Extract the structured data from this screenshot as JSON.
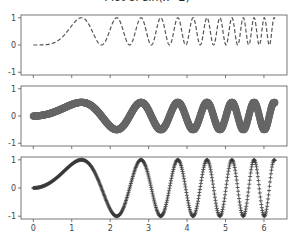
{
  "title": "Plot of sin(x^2)",
  "colors": {
    "axes": "#555555",
    "panel1_line": "#555555",
    "panel2_marker": "#666666",
    "panel3_marker": "#3a3a3a",
    "tick_label": "#444444"
  },
  "chart_data": [
    {
      "type": "line",
      "panel": 1,
      "title": "",
      "function": "sin(x^2)^2",
      "style": "dashed line",
      "xlim": [
        -0.32,
        6.6
      ],
      "ylim": [
        -1.1,
        1.1
      ],
      "yticks": [
        -1,
        0,
        1
      ],
      "xticks": [
        0,
        1,
        2,
        3,
        4,
        5,
        6
      ],
      "x": [
        0,
        0.5,
        1.0,
        1.25,
        1.5,
        1.77,
        2.0,
        2.17,
        2.5,
        2.8,
        3.0,
        3.5,
        4.0,
        4.5,
        5.0,
        5.5,
        6.0,
        6.28
      ],
      "values": [
        0,
        0.06,
        0.71,
        1.0,
        0.61,
        0.0,
        0.57,
        1.0,
        0.0,
        1.0,
        0.17,
        0.1,
        0.08,
        0.88,
        0.02,
        0.42,
        0.98,
        0.96
      ]
    },
    {
      "type": "scatter",
      "panel": 2,
      "function": "0.5*sin(x^2)",
      "style": "large circle markers",
      "xlim": [
        -0.32,
        6.6
      ],
      "ylim": [
        -1.1,
        1.1
      ],
      "yticks": [
        -1,
        0,
        1
      ],
      "xticks": [
        0,
        1,
        2,
        3,
        4,
        5,
        6
      ],
      "x": [
        0,
        0.5,
        1.0,
        1.25,
        1.5,
        1.77,
        2.0,
        2.17,
        2.5,
        2.8,
        3.0,
        3.5,
        4.0,
        4.5,
        5.0,
        5.5,
        6.0,
        6.28
      ],
      "values": [
        0,
        0.12,
        0.42,
        0.5,
        0.39,
        0.0,
        -0.38,
        -0.5,
        0.02,
        0.5,
        0.21,
        -0.16,
        -0.14,
        0.47,
        -0.07,
        0.33,
        -0.5,
        -0.49
      ]
    },
    {
      "type": "scatter",
      "panel": 3,
      "function": "sin(x^2)",
      "style": "plus markers",
      "xlim": [
        -0.32,
        6.6
      ],
      "ylim": [
        -1.1,
        1.1
      ],
      "yticks": [
        -1,
        0,
        1
      ],
      "xticks": [
        0,
        1,
        2,
        3,
        4,
        5,
        6
      ],
      "xlabel_ticks": [
        "0",
        "1",
        "2",
        "3",
        "4",
        "5",
        "6"
      ],
      "x": [
        0,
        0.5,
        1.0,
        1.25,
        1.5,
        1.77,
        2.0,
        2.17,
        2.5,
        2.8,
        3.0,
        3.5,
        4.0,
        4.5,
        5.0,
        5.5,
        6.0,
        6.28
      ],
      "values": [
        0,
        0.25,
        0.84,
        1.0,
        0.78,
        0.0,
        -0.76,
        -1.0,
        0.03,
        1.0,
        0.41,
        -0.31,
        -0.29,
        0.94,
        -0.13,
        0.65,
        -0.99,
        -0.98
      ]
    }
  ],
  "panels": [
    {
      "ytick_labels": [
        "1",
        "0",
        "-1"
      ]
    },
    {
      "ytick_labels": [
        "1",
        "0",
        "-1"
      ]
    },
    {
      "ytick_labels": [
        "1",
        "0",
        "-1"
      ],
      "xtick_labels": [
        "0",
        "1",
        "2",
        "3",
        "4",
        "5",
        "6"
      ]
    }
  ]
}
